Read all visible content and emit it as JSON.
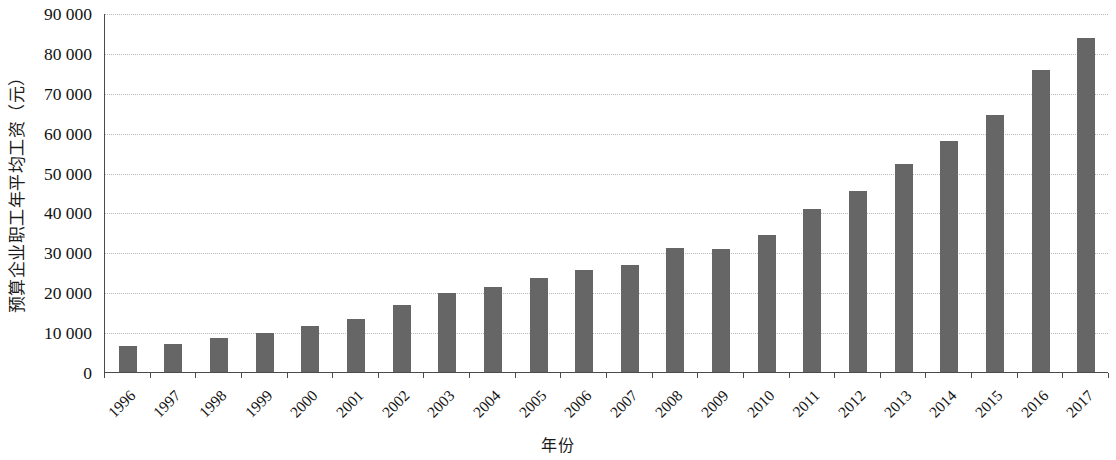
{
  "chart_data": {
    "type": "bar",
    "title": "",
    "xlabel": "年份",
    "ylabel": "预算企业职工年平均工资（元）",
    "ylim": [
      0,
      90000
    ],
    "ytick_labels": [
      "0",
      "10 000",
      "20 000",
      "30 000",
      "40 000",
      "50 000",
      "60 000",
      "70 000",
      "80 000",
      "90 000"
    ],
    "ytick_values": [
      0,
      10000,
      20000,
      30000,
      40000,
      50000,
      60000,
      70000,
      80000,
      90000
    ],
    "grid": true,
    "legend": "none",
    "bar_color": "#666666",
    "axis_color": "#4a4a4a",
    "grid_color": "#b9b9b9",
    "categories": [
      "1996",
      "1997",
      "1998",
      "1999",
      "2000",
      "2001",
      "2002",
      "2003",
      "2004",
      "2005",
      "2006",
      "2007",
      "2008",
      "2009",
      "2010",
      "2011",
      "2012",
      "2013",
      "2014",
      "2015",
      "2016",
      "2017"
    ],
    "values": [
      6500,
      7100,
      8500,
      9800,
      11500,
      13300,
      16900,
      19700,
      21400,
      23500,
      25500,
      26900,
      31000,
      30900,
      34400,
      40900,
      45300,
      52100,
      57900,
      64500,
      75800,
      83700
    ]
  }
}
